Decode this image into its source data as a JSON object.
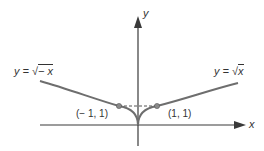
{
  "diagram": {
    "axes": {
      "x_label": "x",
      "y_label": "y"
    },
    "curves": [
      {
        "name": "left-curve",
        "label_lhs": "y = ",
        "label_rad": "− x",
        "equation": "y = √(−x)"
      },
      {
        "name": "right-curve",
        "label_lhs": "y = ",
        "label_rad": "x",
        "equation": "y = √x"
      }
    ],
    "points": [
      {
        "label": "(− 1, 1)",
        "x": -1,
        "y": 1
      },
      {
        "label": "(1, 1)",
        "x": 1,
        "y": 1
      }
    ],
    "colors": {
      "curve": "#6e6e6e",
      "axis": "#3a3a3a",
      "point": "#8a8a8a",
      "dashed": "#555555"
    }
  }
}
